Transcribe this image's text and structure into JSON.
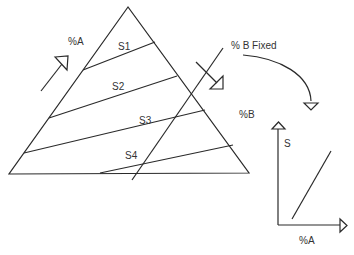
{
  "diagram": {
    "type": "ternary-triangle-with-trend-plot",
    "triangle_labels": {
      "side_label": "%A",
      "regions": [
        "S1",
        "S2",
        "S3",
        "S4"
      ]
    },
    "annotations": {
      "fixed_line_label": "% B Fixed",
      "b_label": "%B"
    },
    "inset_plot": {
      "y_label": "S",
      "x_label": "%A"
    },
    "colors": {
      "stroke": "#2a2a2a",
      "text": "#333333",
      "background": "#ffffff"
    }
  }
}
